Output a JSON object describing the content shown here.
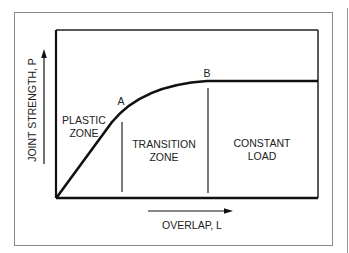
{
  "diagram": {
    "type": "joint-strength-vs-overlap",
    "y_axis_label": "JOINT STRENGTH, P",
    "x_axis_label": "OVERLAP, L",
    "points": [
      {
        "id": "A",
        "label": "A"
      },
      {
        "id": "B",
        "label": "B"
      }
    ],
    "zones": [
      {
        "line1": "PLASTIC",
        "line2": "ZONE"
      },
      {
        "line1": "TRANSITION",
        "line2": "ZONE"
      },
      {
        "line1": "CONSTANT",
        "line2": "LOAD"
      }
    ],
    "colors": {
      "line": "#111111",
      "frame": "#8a8a8a",
      "text": "#222222",
      "background": "#ffffff"
    }
  }
}
